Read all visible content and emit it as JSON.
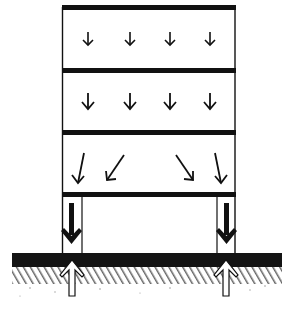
{
  "diagram": {
    "colors": {
      "ink": "#111111",
      "background": "#ffffff",
      "ground_band": "#141414",
      "ground_hatch": "#5a5a5a"
    },
    "structure": {
      "left": 62,
      "right": 235,
      "slabs_y": [
        7,
        70,
        132,
        194
      ],
      "slab_thickness": 5,
      "columns": [
        {
          "name": "left-column",
          "x1": 63,
          "x2": 82
        },
        {
          "name": "right-column",
          "x1": 217,
          "x2": 235
        }
      ]
    },
    "floors": [
      {
        "name": "floor-1",
        "arrow_type": "small-vertical",
        "arrows_x": [
          88,
          130,
          170,
          210
        ],
        "y1": 30,
        "y2": 45
      },
      {
        "name": "floor-2",
        "arrow_type": "vertical",
        "arrows_x": [
          88,
          130,
          170,
          210
        ],
        "y1": 92,
        "y2": 110
      },
      {
        "name": "floor-3",
        "arrow_type": "diagonal",
        "arrows": [
          {
            "x1": 84,
            "y1": 153,
            "x2": 78,
            "y2": 183
          },
          {
            "x1": 124,
            "y1": 155,
            "x2": 107,
            "y2": 180
          },
          {
            "x1": 176,
            "y1": 155,
            "x2": 193,
            "y2": 180
          },
          {
            "x1": 215,
            "y1": 153,
            "x2": 221,
            "y2": 183
          }
        ]
      }
    ],
    "column_loads": [
      {
        "name": "left-column-load",
        "x": 72,
        "y1": 205,
        "y2": 246,
        "direction": "down"
      },
      {
        "name": "right-column-load",
        "x": 226,
        "y1": 205,
        "y2": 246,
        "direction": "down"
      }
    ],
    "ground": {
      "x1": 12,
      "x2": 282,
      "band_top": 253,
      "band_bottom": 268,
      "hatch_bottom": 285
    },
    "ground_reactions": [
      {
        "name": "left-ground-reaction",
        "x": 72,
        "tip_y": 259,
        "bottom_y": 296,
        "direction": "up"
      },
      {
        "name": "right-ground-reaction",
        "x": 226,
        "tip_y": 259,
        "bottom_y": 296,
        "direction": "up"
      }
    ]
  }
}
